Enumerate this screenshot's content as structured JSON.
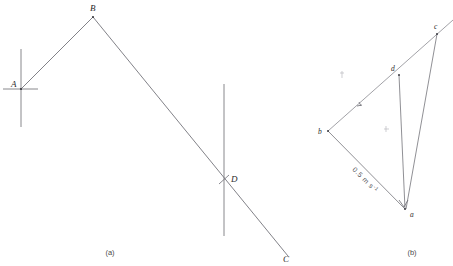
{
  "figure": {
    "width": 453,
    "height": 266,
    "background": "#ffffff",
    "stroke_color": "#6b6b72",
    "label_color": "#2b2b2b"
  },
  "panel_a": {
    "caption": "(a)",
    "caption_pos": {
      "x": 110,
      "y": 255
    },
    "points": [
      {
        "id": "A",
        "label": "A",
        "x": 21,
        "y": 89,
        "label_x": 11,
        "label_y": 87
      },
      {
        "id": "B",
        "label": "B",
        "x": 93,
        "y": 17,
        "label_x": 91,
        "label_y": 11
      },
      {
        "id": "D",
        "label": "D",
        "x": 224,
        "y": 180,
        "label_x": 231,
        "label_y": 181
      },
      {
        "id": "C",
        "label": "C",
        "x": 286,
        "y": 253,
        "label_x": 285,
        "label_y": 261
      }
    ],
    "segments": [
      {
        "name": "segment-ab",
        "from": "A",
        "to": "B"
      },
      {
        "name": "segment-bc",
        "from": "B",
        "to": "C"
      }
    ],
    "axes": [
      {
        "name": "vertical-axis-at-a",
        "x1": 21,
        "y1": 49,
        "x2": 21,
        "y2": 127
      },
      {
        "name": "horizontal-tick-at-a",
        "x1": 3,
        "y1": 89,
        "x2": 38,
        "y2": 89
      },
      {
        "name": "vertical-axis-at-d",
        "x1": 224,
        "y1": 84,
        "x2": 224,
        "y2": 236
      }
    ],
    "cross_tick": {
      "name": "cross-tick-at-d",
      "x1": 219,
      "y1": 176,
      "x2": 229,
      "y2": 185
    }
  },
  "panel_b": {
    "caption": "(b)",
    "caption_pos": {
      "x": 412,
      "y": 255
    },
    "points": [
      {
        "id": "a",
        "label": "a",
        "x": 405,
        "y": 209,
        "label_x": 410,
        "label_y": 216
      },
      {
        "id": "b",
        "label": "b",
        "x": 328,
        "y": 131,
        "label_x": 319,
        "label_y": 133
      },
      {
        "id": "c",
        "label": "c",
        "x": 437,
        "y": 34,
        "label_x": 434,
        "label_y": 28
      },
      {
        "id": "d",
        "label": "d",
        "x": 399,
        "y": 75,
        "label_x": 392,
        "label_y": 70
      }
    ],
    "segments": [
      {
        "name": "vector-ba",
        "from": "b",
        "to": "a"
      },
      {
        "name": "vector-bd",
        "from": "b",
        "to": "d"
      },
      {
        "name": "vector-da",
        "from": "d",
        "to": "a"
      },
      {
        "name": "vector-ca",
        "from": "c",
        "to": "a"
      }
    ],
    "ray": {
      "name": "ray-through-b-d-c",
      "x1": 328,
      "y1": 131,
      "x2": 453,
      "y2": 20
    },
    "speed_label": {
      "text": "0.5 m s",
      "superscript": "-1",
      "x": 356,
      "y": 172,
      "rotation": 45
    },
    "arrow_marks": [
      {
        "name": "arrowhead-on-bd",
        "x": 360,
        "y": 106
      },
      {
        "name": "arrowhead-at-a",
        "x": 403,
        "y": 205
      }
    ],
    "faint_marks": [
      {
        "name": "faint-mark-upper-left",
        "x": 342,
        "y": 75
      },
      {
        "name": "faint-mark-center",
        "x": 386,
        "y": 129
      }
    ]
  }
}
